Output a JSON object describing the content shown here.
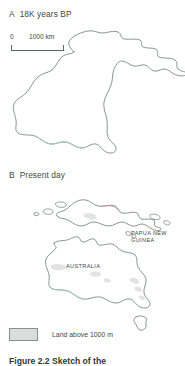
{
  "figure": {
    "caption": "Figure 2.2 Sketch of the",
    "panels": [
      {
        "letter": "A",
        "title": "18K years BP"
      },
      {
        "letter": "B",
        "title": "Present day"
      }
    ],
    "scalebar": {
      "min_label": "0",
      "max_label": "1000 km"
    },
    "map_labels": [
      {
        "name": "papua-new-guinea",
        "line1": "PAPUA NEW",
        "line2": "GUINEA"
      },
      {
        "name": "australia",
        "text": "AUSTRALIA"
      }
    ],
    "legend": {
      "label": "Land above 1000 m",
      "swatch_color": "#dcdcdc"
    },
    "colors": {
      "background": "#ffffff",
      "coastline": "#6e7873",
      "text": "#3e4a42",
      "upland_fill": "#e3e3e3",
      "border_line": "#c98a8e",
      "coast_tint": "#9ccdb4"
    }
  }
}
